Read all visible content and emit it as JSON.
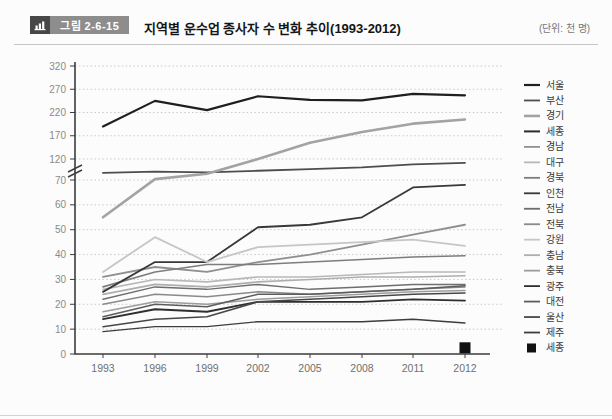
{
  "header": {
    "figure_label": "그림 2-6-15",
    "title": "지역별 운수업 종사자 수 변화 추이(1993-2012)",
    "unit": "(단위: 천 명)"
  },
  "chart_data": {
    "type": "line",
    "title": "지역별 운수업 종사자 수 변화 추이(1993-2012)",
    "unit": "천 명",
    "x": [
      1993,
      1996,
      1999,
      2002,
      2005,
      2008,
      2011,
      2012
    ],
    "xlabel": "",
    "ylabel": "",
    "grid": true,
    "legend_position": "right",
    "axis_break": {
      "lower_range": [
        0,
        70
      ],
      "upper_range": [
        120,
        320
      ]
    },
    "yticks_lower": [
      0,
      10,
      20,
      30,
      40,
      50,
      60,
      70
    ],
    "yticks_upper": [
      120,
      170,
      220,
      270,
      320
    ],
    "series": [
      {
        "name": "서울",
        "color": "#1f1f1f",
        "width": 2.2,
        "values": [
          190,
          245,
          225,
          255,
          247,
          246,
          260,
          257
        ]
      },
      {
        "name": "부산",
        "color": "#4d4d4d",
        "width": 1.8,
        "values": [
          87,
          90,
          88,
          92,
          96,
          100,
          107,
          111
        ]
      },
      {
        "name": "경기",
        "color": "#a3a3a3",
        "width": 2.6,
        "values": [
          55,
          72,
          85,
          120,
          155,
          178,
          196,
          205
        ]
      },
      {
        "name": "세종",
        "color": "#2b2b2b",
        "width": 2.0,
        "values": [
          null,
          null,
          null,
          null,
          null,
          null,
          null,
          null
        ]
      },
      {
        "name": "경남",
        "color": "#8f8f8f",
        "width": 1.8,
        "values": [
          31,
          35,
          33,
          37,
          40,
          44,
          48,
          52
        ]
      },
      {
        "name": "대구",
        "color": "#b8b8b8",
        "width": 1.6,
        "values": [
          26,
          30,
          29,
          31,
          31,
          32,
          33,
          33
        ]
      },
      {
        "name": "경북",
        "color": "#7d7d7d",
        "width": 1.6,
        "values": [
          27,
          33,
          36,
          36,
          37,
          38,
          39,
          39.5
        ]
      },
      {
        "name": "인천",
        "color": "#383838",
        "width": 1.8,
        "values": [
          25,
          37,
          37,
          51,
          52,
          55,
          67,
          68
        ]
      },
      {
        "name": "전남",
        "color": "#6e6e6e",
        "width": 1.5,
        "values": [
          22,
          27,
          26,
          28,
          26,
          27,
          28,
          28
        ]
      },
      {
        "name": "전북",
        "color": "#8a8a8a",
        "width": 1.5,
        "values": [
          20,
          24,
          23,
          25,
          24,
          25,
          26,
          27
        ]
      },
      {
        "name": "강원",
        "color": "#c6c6c6",
        "width": 1.8,
        "values": [
          33,
          47,
          37,
          43,
          44,
          45,
          46,
          43.5
        ]
      },
      {
        "name": "충남",
        "color": "#aeaeae",
        "width": 1.6,
        "values": [
          24,
          28,
          27,
          29,
          30,
          31,
          31,
          31.5
        ]
      },
      {
        "name": "충북",
        "color": "#9c9c9c",
        "width": 1.5,
        "values": [
          17,
          21,
          20,
          22,
          23,
          24,
          25,
          25.5
        ]
      },
      {
        "name": "광주",
        "color": "#2e2e2e",
        "width": 1.8,
        "values": [
          14,
          18,
          17,
          21,
          21,
          21,
          22,
          21.5
        ]
      },
      {
        "name": "대전",
        "color": "#5c5c5c",
        "width": 1.5,
        "values": [
          15,
          20,
          19,
          24,
          24,
          25,
          26,
          27.5
        ]
      },
      {
        "name": "울산",
        "color": "#474747",
        "width": 1.5,
        "values": [
          11,
          14,
          15,
          21,
          22,
          23,
          24,
          24.5
        ]
      },
      {
        "name": "제주",
        "color": "#3d3d3d",
        "width": 1.4,
        "values": [
          9,
          11,
          11,
          13,
          13,
          13,
          14,
          12.5
        ]
      },
      {
        "name": "세종",
        "color": "#111111",
        "width": 0,
        "marker": "square",
        "values": [
          null,
          null,
          null,
          null,
          null,
          null,
          null,
          2.5
        ]
      }
    ]
  }
}
